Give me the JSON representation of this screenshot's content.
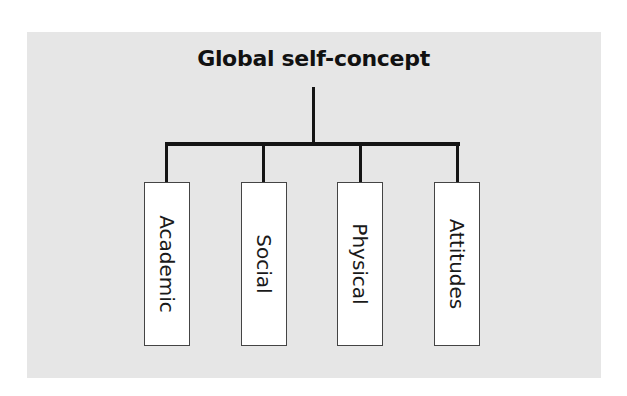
{
  "diagram": {
    "title": "Global self-concept",
    "children": [
      {
        "label": "Academic"
      },
      {
        "label": "Social"
      },
      {
        "label": "Physical"
      },
      {
        "label": "Attitudes"
      }
    ],
    "colors": {
      "background_panel": "#e6e6e6",
      "lines": "#141414",
      "box_fill": "#ffffff",
      "box_border": "#444444"
    }
  }
}
